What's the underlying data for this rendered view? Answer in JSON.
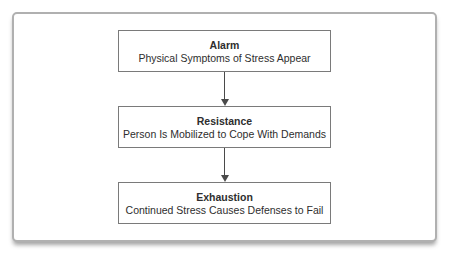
{
  "diagram": {
    "type": "flowchart",
    "direction": "top-to-bottom",
    "boxes": [
      {
        "title": "Alarm",
        "subtitle": "Physical Symptoms of Stress Appear"
      },
      {
        "title": "Resistance",
        "subtitle": "Person Is Mobilized to Cope With Demands"
      },
      {
        "title": "Exhaustion",
        "subtitle": "Continued Stress Causes Defenses to Fail"
      }
    ],
    "connectors": [
      {
        "from": "Alarm",
        "to": "Resistance",
        "style": "arrow-down"
      },
      {
        "from": "Resistance",
        "to": "Exhaustion",
        "style": "arrow-down"
      }
    ],
    "colors": {
      "background": "#ffffff",
      "frame_border": "#b0b0b0",
      "box_border": "#7a7a7a",
      "arrow": "#4a4a4a",
      "text": "#2e2e2e"
    }
  }
}
